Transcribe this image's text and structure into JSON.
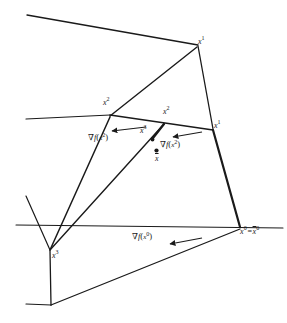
{
  "figure": {
    "kind": "geometry-diagram",
    "width": 287,
    "height": 323,
    "background_color": "#ffffff",
    "ink_color": "#1a1a1a"
  },
  "labels": {
    "x1_top": "x1",
    "x2_left": "x2",
    "x2_mid": "x2",
    "x3_mid": "x3",
    "x1_right": "x1",
    "x3_bottom": "x3",
    "x0_pair": "x0=x0",
    "grad_x2_left": "∇f(x2)",
    "grad_x2_right": "∇f(x2)",
    "grad_x0": "∇f(x0)",
    "xbar_center": "x"
  },
  "label_parts": {
    "x_letter": "x",
    "sup_0": "0",
    "sup_1": "1",
    "sup_2": "2",
    "sup_3": "3",
    "nabla": "∇",
    "f_letter": "f",
    "paren_open": "(",
    "paren_close": ")",
    "equals": "=",
    "xbar": "x"
  },
  "points": [
    {
      "name": "x1-top",
      "label": "x1",
      "x": 198,
      "y": 45
    },
    {
      "name": "x2-left",
      "label": "x2",
      "x": 109,
      "y": 114
    },
    {
      "name": "x2-mid",
      "label": "x2",
      "x": 163,
      "y": 123
    },
    {
      "name": "x3-mid",
      "label": "x3",
      "x": 152,
      "y": 135
    },
    {
      "name": "x1-right",
      "label": "x1",
      "x": 213,
      "y": 129
    },
    {
      "name": "x3-bottom",
      "label": "x3",
      "x": 50,
      "y": 252
    },
    {
      "name": "x0",
      "label": "x0",
      "x": 240,
      "y": 228
    },
    {
      "name": "xbar",
      "label": "x",
      "x": 157,
      "y": 155
    }
  ],
  "gradient_vectors": [
    {
      "name": "grad-f-x2-left",
      "label": "∇f(x2)",
      "from_x": 144,
      "from_y": 128,
      "to_x": 112,
      "to_y": 131
    },
    {
      "name": "grad-f-x2-right",
      "label": "∇f(x2)",
      "from_x": 200,
      "from_y": 133,
      "to_x": 173,
      "to_y": 137
    },
    {
      "name": "grad-f-x0",
      "label": "∇f(x0)",
      "from_x": 200,
      "from_y": 238,
      "to_x": 170,
      "to_y": 244
    }
  ],
  "hyperplanes": [
    {
      "name": "cut-line-top",
      "x1": 28,
      "y1": 16,
      "x2": 198,
      "y2": 45
    },
    {
      "name": "cut-line-middle",
      "x1": 27,
      "y1": 119,
      "x2": 213,
      "y2": 129
    },
    {
      "name": "cut-line-bottom",
      "x1": 17,
      "y1": 225,
      "x2": 283,
      "y2": 228
    }
  ]
}
